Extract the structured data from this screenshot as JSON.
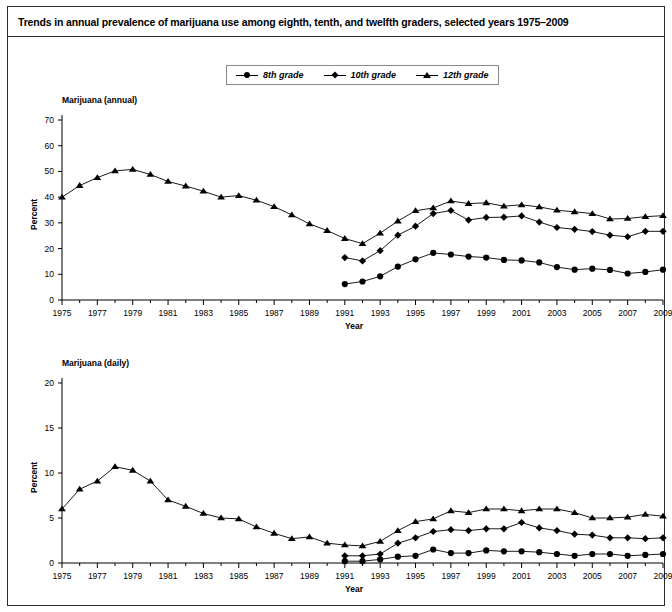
{
  "figure": {
    "title": "Trends in annual prevalence of marijuana use among eighth, tenth, and twelfth graders, selected years 1975–2009",
    "border_color": "#2b2b2b",
    "background": "#ffffff",
    "series_color": "#000000"
  },
  "legend": {
    "position": "top-center",
    "items": [
      {
        "label": "8th grade",
        "marker": "circle-marker"
      },
      {
        "label": "10th grade",
        "marker": "diamond-marker"
      },
      {
        "label": "12th grade",
        "marker": "triangle-marker"
      }
    ]
  },
  "chart_data": [
    {
      "type": "line",
      "title": "Marijuana (annual)",
      "xlabel": "Year",
      "ylabel": "Percent",
      "ylim": [
        0,
        70
      ],
      "yticks": [
        0,
        10,
        20,
        30,
        40,
        50,
        60,
        70
      ],
      "xlim": [
        1975,
        2009
      ],
      "xticks": [
        1975,
        1977,
        1979,
        1981,
        1983,
        1985,
        1987,
        1989,
        1991,
        1993,
        1995,
        1997,
        1999,
        2001,
        2003,
        2005,
        2007,
        2009
      ],
      "grid": false,
      "legend": "top-center",
      "x": [
        1975,
        1976,
        1977,
        1978,
        1979,
        1980,
        1981,
        1982,
        1983,
        1984,
        1985,
        1986,
        1987,
        1988,
        1989,
        1990,
        1991,
        1992,
        1993,
        1994,
        1995,
        1996,
        1997,
        1998,
        1999,
        2000,
        2001,
        2002,
        2003,
        2004,
        2005,
        2006,
        2007,
        2008,
        2009
      ],
      "series": [
        {
          "name": "12th grade",
          "marker": "triangle-marker",
          "x": [
            1975,
            1976,
            1977,
            1978,
            1979,
            1980,
            1981,
            1982,
            1983,
            1984,
            1985,
            1986,
            1987,
            1988,
            1989,
            1990,
            1991,
            1992,
            1993,
            1994,
            1995,
            1996,
            1997,
            1998,
            1999,
            2000,
            2001,
            2002,
            2003,
            2004,
            2005,
            2006,
            2007,
            2008,
            2009
          ],
          "values": [
            40.0,
            44.5,
            47.6,
            50.2,
            50.8,
            48.8,
            46.1,
            44.3,
            42.3,
            40.0,
            40.6,
            38.8,
            36.3,
            33.1,
            29.6,
            27.0,
            23.9,
            21.9,
            26.0,
            30.7,
            34.7,
            35.8,
            38.5,
            37.5,
            37.8,
            36.5,
            37.0,
            36.2,
            34.9,
            34.3,
            33.6,
            31.5,
            31.7,
            32.4,
            32.8
          ]
        },
        {
          "name": "10th grade",
          "marker": "diamond-marker",
          "x": [
            1991,
            1992,
            1993,
            1994,
            1995,
            1996,
            1997,
            1998,
            1999,
            2000,
            2001,
            2002,
            2003,
            2004,
            2005,
            2006,
            2007,
            2008,
            2009
          ],
          "values": [
            16.5,
            15.2,
            19.2,
            25.2,
            28.7,
            33.6,
            34.8,
            31.1,
            32.1,
            32.2,
            32.7,
            30.3,
            28.2,
            27.5,
            26.6,
            25.2,
            24.6,
            26.7,
            26.7
          ]
        },
        {
          "name": "8th grade",
          "marker": "circle-marker",
          "x": [
            1991,
            1992,
            1993,
            1994,
            1995,
            1996,
            1997,
            1998,
            1999,
            2000,
            2001,
            2002,
            2003,
            2004,
            2005,
            2006,
            2007,
            2008,
            2009
          ],
          "values": [
            6.2,
            7.2,
            9.2,
            13.0,
            15.8,
            18.3,
            17.7,
            16.9,
            16.5,
            15.6,
            15.4,
            14.6,
            12.8,
            11.8,
            12.2,
            11.7,
            10.3,
            10.9,
            11.8
          ]
        }
      ]
    },
    {
      "type": "line",
      "title": "Marijuana (daily)",
      "xlabel": "Year",
      "ylabel": "Percent",
      "ylim": [
        0,
        20
      ],
      "yticks": [
        0,
        5,
        10,
        15,
        20
      ],
      "xlim": [
        1975,
        2009
      ],
      "xticks": [
        1975,
        1977,
        1979,
        1981,
        1983,
        1985,
        1987,
        1989,
        1991,
        1993,
        1995,
        1997,
        1999,
        2001,
        2003,
        2005,
        2007,
        2009
      ],
      "grid": false,
      "legend": "none",
      "x": [
        1975,
        1976,
        1977,
        1978,
        1979,
        1980,
        1981,
        1982,
        1983,
        1984,
        1985,
        1986,
        1987,
        1988,
        1989,
        1990,
        1991,
        1992,
        1993,
        1994,
        1995,
        1996,
        1997,
        1998,
        1999,
        2000,
        2001,
        2002,
        2003,
        2004,
        2005,
        2006,
        2007,
        2008,
        2009
      ],
      "series": [
        {
          "name": "12th grade",
          "marker": "triangle-marker",
          "x": [
            1975,
            1976,
            1977,
            1978,
            1979,
            1980,
            1981,
            1982,
            1983,
            1984,
            1985,
            1986,
            1987,
            1988,
            1989,
            1990,
            1991,
            1992,
            1993,
            1994,
            1995,
            1996,
            1997,
            1998,
            1999,
            2000,
            2001,
            2002,
            2003,
            2004,
            2005,
            2006,
            2007,
            2008,
            2009
          ],
          "values": [
            6.0,
            8.2,
            9.1,
            10.7,
            10.3,
            9.1,
            7.0,
            6.3,
            5.5,
            5.0,
            4.9,
            4.0,
            3.3,
            2.7,
            2.9,
            2.2,
            2.0,
            1.9,
            2.4,
            3.6,
            4.6,
            4.9,
            5.8,
            5.6,
            6.0,
            6.0,
            5.8,
            6.0,
            6.0,
            5.6,
            5.0,
            5.0,
            5.1,
            5.4,
            5.2
          ]
        },
        {
          "name": "10th grade",
          "marker": "diamond-marker",
          "x": [
            1991,
            1992,
            1993,
            1994,
            1995,
            1996,
            1997,
            1998,
            1999,
            2000,
            2001,
            2002,
            2003,
            2004,
            2005,
            2006,
            2007,
            2008,
            2009
          ],
          "values": [
            0.8,
            0.8,
            1.0,
            2.2,
            2.8,
            3.5,
            3.7,
            3.6,
            3.8,
            3.8,
            4.5,
            3.9,
            3.6,
            3.2,
            3.1,
            2.8,
            2.8,
            2.7,
            2.8
          ]
        },
        {
          "name": "8th grade",
          "marker": "circle-marker",
          "x": [
            1991,
            1992,
            1993,
            1994,
            1995,
            1996,
            1997,
            1998,
            1999,
            2000,
            2001,
            2002,
            2003,
            2004,
            2005,
            2006,
            2007,
            2008,
            2009
          ],
          "values": [
            0.2,
            0.2,
            0.4,
            0.7,
            0.8,
            1.5,
            1.1,
            1.1,
            1.4,
            1.3,
            1.3,
            1.2,
            1.0,
            0.8,
            1.0,
            1.0,
            0.8,
            0.9,
            1.0
          ]
        }
      ]
    }
  ]
}
